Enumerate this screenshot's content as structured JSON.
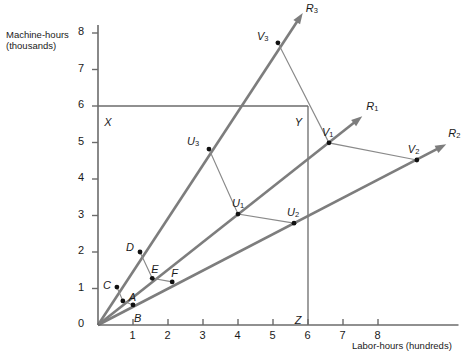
{
  "chart_data": {
    "type": "scatter",
    "title": "",
    "xlabel": "Labor-hours (hundreds)",
    "ylabel_line1": "Machine-hours",
    "ylabel_line2": "(thousands)",
    "xlim": [
      0,
      8.9
    ],
    "ylim": [
      0,
      8.2
    ],
    "xticks": [
      "0",
      "1",
      "2",
      "3",
      "4",
      "5",
      "6",
      "7",
      "8"
    ],
    "xtick_values": [
      0,
      1,
      2,
      3,
      4,
      5,
      6,
      7,
      8
    ],
    "yticks": [
      "0",
      "1",
      "2",
      "3",
      "4",
      "5",
      "6",
      "7",
      "8"
    ],
    "ytick_values": [
      0,
      1,
      2,
      3,
      4,
      5,
      6,
      7,
      8
    ],
    "grid": false,
    "legend": "none",
    "points": [
      {
        "label": "A",
        "x": 0.71,
        "y": 0.66,
        "label_dx": 6,
        "label_dy": -2
      },
      {
        "label": "B",
        "x": 1.0,
        "y": 0.55,
        "label_dx": 1,
        "label_dy": 15
      },
      {
        "label": "C",
        "x": 0.54,
        "y": 1.04,
        "label_dx": -14,
        "label_dy": 0
      },
      {
        "label": "D",
        "x": 1.2,
        "y": 2.0,
        "label_dx": -14,
        "label_dy": -3
      },
      {
        "label": "E",
        "x": 1.55,
        "y": 1.28,
        "label_dx": -1,
        "label_dy": -7
      },
      {
        "label": "F",
        "x": 2.12,
        "y": 1.18,
        "label_dx": -1,
        "label_dy": -7
      },
      {
        "label": "U",
        "sub": "1",
        "x": 4.0,
        "y": 3.04,
        "label_dx": -6,
        "label_dy": -9
      },
      {
        "label": "U",
        "sub": "2",
        "x": 5.6,
        "y": 2.79,
        "label_dx": -7,
        "label_dy": -9
      },
      {
        "label": "U",
        "sub": "3",
        "x": 3.17,
        "y": 4.82,
        "label_dx": -22,
        "label_dy": -6
      },
      {
        "label": "V",
        "sub": "1",
        "x": 6.6,
        "y": 4.99,
        "label_dx": -7,
        "label_dy": -9
      },
      {
        "label": "V",
        "sub": "2",
        "x": 9.11,
        "y": 4.52,
        "label_dx": -9,
        "label_dy": -9
      },
      {
        "label": "V",
        "sub": "3",
        "x": 5.14,
        "y": 7.73,
        "label_dx": -21,
        "label_dy": -5
      }
    ],
    "rays": [
      {
        "label": "R",
        "sub": "1",
        "from": [
          0,
          0
        ],
        "to": [
          7.55,
          5.72
        ],
        "label_dx": 4,
        "label_dy": -8
      },
      {
        "label": "R",
        "sub": "2",
        "from": [
          0,
          0
        ],
        "to": [
          9.95,
          4.95
        ],
        "label_dx": 2,
        "label_dy": -9
      },
      {
        "label": "R",
        "sub": "3",
        "from": [
          0,
          0
        ],
        "to": [
          5.85,
          8.55
        ],
        "label_dx": 3,
        "label_dy": -3
      }
    ],
    "polylines": [
      {
        "name": "isoquant-1",
        "points": [
          [
            0.54,
            1.04
          ],
          [
            0.71,
            0.66
          ],
          [
            1.0,
            0.55
          ]
        ]
      },
      {
        "name": "isoquant-2",
        "points": [
          [
            1.2,
            2.0
          ],
          [
            1.55,
            1.28
          ],
          [
            2.12,
            1.18
          ]
        ]
      },
      {
        "name": "isoquant-3",
        "points": [
          [
            3.17,
            4.82
          ],
          [
            4.0,
            3.04
          ],
          [
            5.6,
            2.79
          ]
        ]
      },
      {
        "name": "isoquant-4",
        "points": [
          [
            5.14,
            7.73
          ],
          [
            6.6,
            4.99
          ],
          [
            9.11,
            4.52
          ]
        ]
      }
    ],
    "reference_lines": [
      {
        "name": "horizontal-at-6",
        "label": "X",
        "from": [
          0,
          6.0
        ],
        "to": [
          6.0,
          6.0
        ]
      },
      {
        "name": "vertical-at-6",
        "label": "Z",
        "from": [
          6.0,
          6.0
        ],
        "to": [
          6.0,
          0
        ]
      }
    ],
    "reference_labels": [
      {
        "label": "X",
        "x": 0.18,
        "y": 5.72
      },
      {
        "label": "Y",
        "x": 5.62,
        "y": 5.72
      },
      {
        "label": "Z",
        "x": 5.62,
        "y": 0.3
      }
    ],
    "colors": {
      "axis": "#6b6b6b",
      "ray": "#7d7d7d",
      "isoquant": "#8a8a8a",
      "marker": "#111111",
      "text": "#1a1a1a",
      "background": "#ffffff"
    }
  }
}
